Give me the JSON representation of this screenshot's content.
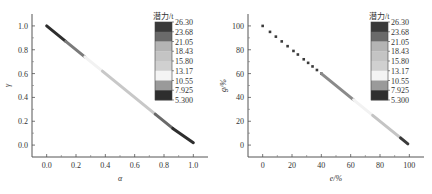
{
  "chart_data": [
    {
      "type": "scatter",
      "title": "",
      "xlabel": "α",
      "ylabel": "γ",
      "xlim": [
        -0.1,
        1.1
      ],
      "ylim": [
        -0.1,
        1.1
      ],
      "xticks": [
        "0.0",
        "0.2",
        "0.4",
        "0.6",
        "0.8",
        "1.0"
      ],
      "yticks": [
        "0.0",
        "0.2",
        "0.4",
        "0.6",
        "0.8",
        "1.0"
      ],
      "grid": false,
      "colorbar": {
        "title": "潜力/t",
        "levels": [
          "26.30",
          "23.68",
          "21.05",
          "18.43",
          "15.80",
          "13.17",
          "10.55",
          "7.925",
          "5.300"
        ],
        "colors": [
          "#3a3a3a",
          "#6a6a6a",
          "#b4b4b4",
          "#c4c4c4",
          "#d0d0d0",
          "#f4f4f4",
          "#9a9a9a",
          "#2e2e2e"
        ]
      },
      "series": [
        {
          "name": "segment-1",
          "x": [
            0.0,
            0.13
          ],
          "y": [
            1.0,
            0.87
          ],
          "color": "#2e2e2e"
        },
        {
          "name": "segment-2",
          "x": [
            0.13,
            0.26
          ],
          "y": [
            0.87,
            0.74
          ],
          "color": "#7a7a7a"
        },
        {
          "name": "segment-3",
          "x": [
            0.26,
            0.38
          ],
          "y": [
            0.74,
            0.62
          ],
          "color": "#f2f2f2"
        },
        {
          "name": "segment-4",
          "x": [
            0.38,
            0.74
          ],
          "y": [
            0.62,
            0.26
          ],
          "color": "#c8c8c8"
        },
        {
          "name": "segment-5",
          "x": [
            0.74,
            0.86
          ],
          "y": [
            0.26,
            0.14
          ],
          "color": "#6a6a6a"
        },
        {
          "name": "segment-6",
          "x": [
            0.86,
            1.0
          ],
          "y": [
            0.14,
            0.02
          ],
          "color": "#2e2e2e"
        }
      ]
    },
    {
      "type": "scatter",
      "title": "",
      "xlabel": "e/%",
      "ylabel": "g/%",
      "xlim": [
        -10,
        110
      ],
      "ylim": [
        -10,
        110
      ],
      "xticks": [
        "0",
        "20",
        "40",
        "60",
        "80",
        "100"
      ],
      "yticks": [
        "0",
        "20",
        "40",
        "60",
        "80",
        "100"
      ],
      "grid": false,
      "colorbar": {
        "title": "潜力/t",
        "levels": [
          "26.30",
          "23.68",
          "21.05",
          "18.43",
          "15.80",
          "13.17",
          "10.55",
          "7.925",
          "5.300"
        ],
        "colors": [
          "#3a3a3a",
          "#6a6a6a",
          "#b4b4b4",
          "#c4c4c4",
          "#d0d0d0",
          "#f4f4f4",
          "#9a9a9a",
          "#2e2e2e"
        ]
      },
      "series": [
        {
          "name": "sparse-points",
          "x": [
            0,
            5,
            9,
            13,
            17,
            21,
            24,
            28,
            31,
            34,
            37,
            40
          ],
          "y": [
            100,
            95,
            91,
            87,
            83,
            79,
            76,
            72,
            69,
            66,
            63,
            60
          ],
          "color": "#3a3a3a"
        },
        {
          "name": "segment-2",
          "x": [
            40,
            62
          ],
          "y": [
            60,
            38
          ],
          "color": "#8a8a8a"
        },
        {
          "name": "segment-3",
          "x": [
            62,
            75
          ],
          "y": [
            38,
            25
          ],
          "color": "#f2f2f2"
        },
        {
          "name": "segment-4",
          "x": [
            75,
            94
          ],
          "y": [
            25,
            6
          ],
          "color": "#c4c4c4"
        },
        {
          "name": "segment-5",
          "x": [
            94,
            99
          ],
          "y": [
            6,
            1
          ],
          "color": "#3a3a3a"
        }
      ]
    }
  ]
}
